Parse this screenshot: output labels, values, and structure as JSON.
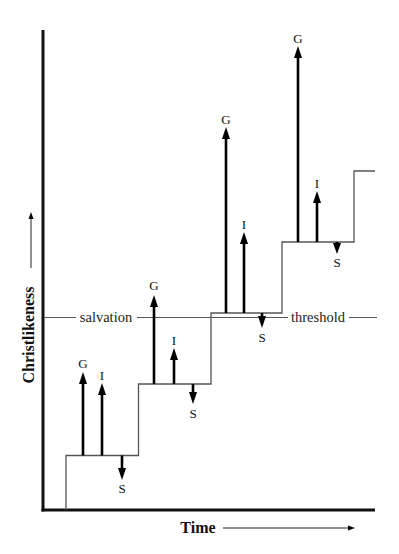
{
  "axes": {
    "y_label": "Christlikeness",
    "x_label": "Time"
  },
  "threshold": {
    "left_label": "salvation",
    "right_label": "threshold"
  },
  "steps": [
    {
      "forces": [
        {
          "label": "G",
          "direction": "up"
        },
        {
          "label": "I",
          "direction": "up"
        },
        {
          "label": "S",
          "direction": "down"
        }
      ]
    },
    {
      "forces": [
        {
          "label": "G",
          "direction": "up"
        },
        {
          "label": "I",
          "direction": "up"
        },
        {
          "label": "S",
          "direction": "down"
        }
      ]
    },
    {
      "forces": [
        {
          "label": "G",
          "direction": "up"
        },
        {
          "label": "I",
          "direction": "up"
        },
        {
          "label": "S",
          "direction": "down"
        }
      ]
    },
    {
      "forces": [
        {
          "label": "G",
          "direction": "up"
        },
        {
          "label": "I",
          "direction": "up"
        },
        {
          "label": "S",
          "direction": "down"
        }
      ]
    }
  ]
}
